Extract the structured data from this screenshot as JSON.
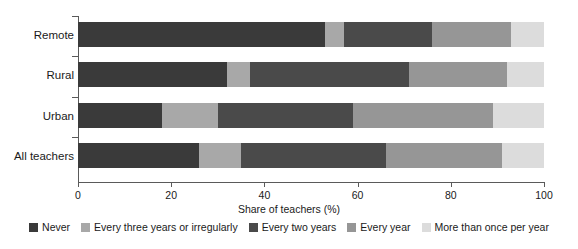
{
  "chart_data": {
    "type": "bar",
    "orientation": "horizontal",
    "stacked": true,
    "title": "",
    "xlabel": "Share of teachers (%)",
    "ylabel": "",
    "xlim": [
      0,
      100
    ],
    "xticks": [
      0,
      20,
      40,
      60,
      80,
      100
    ],
    "xtick_labels": [
      "0",
      "20",
      "40",
      "60",
      "80",
      "100"
    ],
    "grid": false,
    "legend_position": "bottom",
    "categories": [
      "Remote",
      "Rural",
      "Urban",
      "All teachers"
    ],
    "series": [
      {
        "name": "Never",
        "color": "#3a3a3a",
        "values": [
          53,
          32,
          18,
          26
        ]
      },
      {
        "name": "Every three years or irregularly",
        "color": "#a8a8a8",
        "values": [
          4,
          5,
          12,
          9
        ]
      },
      {
        "name": "Every two years",
        "color": "#4a4a4a",
        "values": [
          19,
          34,
          29,
          31
        ]
      },
      {
        "name": "Every year",
        "color": "#969696",
        "values": [
          17,
          21,
          30,
          25
        ]
      },
      {
        "name": "More than once per year",
        "color": "#dcdcdc",
        "values": [
          7,
          8,
          11,
          9
        ]
      }
    ]
  }
}
